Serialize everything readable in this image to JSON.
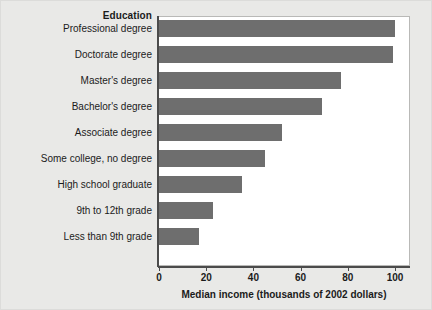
{
  "chart_data": {
    "type": "bar",
    "orientation": "horizontal",
    "title": "",
    "category_axis_title": "Education",
    "xlabel": "Median income (thousands of 2002 dollars)",
    "ylabel": "Education",
    "xlim": [
      0,
      105
    ],
    "xticks": [
      0,
      20,
      40,
      60,
      80,
      100
    ],
    "xtick_labels": [
      "0",
      "20",
      "40",
      "60",
      "80",
      "100"
    ],
    "grid": false,
    "legend": false,
    "bar_color": "#6e6e6e",
    "categories": [
      "Professional degree",
      "Doctorate degree",
      "Master's degree",
      "Bachelor's degree",
      "Associate degree",
      "Some college, no degree",
      "High school graduate",
      "9th to 12th grade",
      "Less than 9th grade"
    ],
    "values": [
      100,
      99,
      77,
      69,
      52,
      45,
      35,
      23,
      17
    ],
    "units": "thousands of 2002 dollars"
  },
  "figure": {
    "background_color": "#e9e9e7",
    "plot_background_color": "#ffffff",
    "axis_color": "#4b4b4b"
  }
}
